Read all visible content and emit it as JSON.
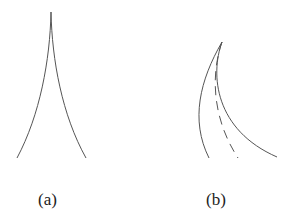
{
  "figure": {
    "panels": [
      {
        "label": "(a)",
        "description": "cusp: two concave curves meeting at a sharp top point"
      },
      {
        "label": "(b)",
        "description": "three curves fanning from a common tip: left solid, middle dashed, right solid"
      }
    ],
    "stroke_color": "#555555"
  }
}
